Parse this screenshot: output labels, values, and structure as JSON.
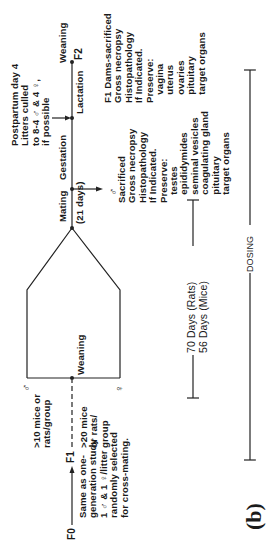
{
  "figure": {
    "panel_label": "(b)",
    "orientation": "rotated 90 degrees counterclockwise",
    "f0": {
      "label": "F0",
      "description": "Same as one-\ngeneration study\n1 ♂ & 1 ♀/litter\nrandomly selected\nfor cross-mating."
    },
    "f1": {
      "label": "F1"
    },
    "f2": {
      "label": "F2"
    },
    "male_branch": {
      "symbol": "♂",
      "group_text": ">10 mice or\nrats/group"
    },
    "female_branch": {
      "symbol": "♀",
      "group_text": ">20 mice\nor rats/\ngroup"
    },
    "events": {
      "weaning_f1": "Weaning",
      "mating": "Mating",
      "mating_duration": "(21 days)",
      "gestation": "Gestation",
      "lactation": "Lactation",
      "weaning_f2": "Weaning"
    },
    "postpartum_note": "Postpartum day 4\nLitters culled\nto 8-4 ♂ & 4 ♀,\nif possible",
    "male_sacrifice": {
      "symbol": "♂",
      "text": "Sacrificed\nGross necropsy\nHistopathology\nIf Indicated.\nPreserve:\n   testes\n   epididymides\n   seminal vesicles\n   coagulating gland\n   pituitary\n   target organs"
    },
    "dam_sacrifice": {
      "text": "F1 Dams-sacrificed\nGross necropsy\nHistopathology\nIf Indicated.\nPreserve:\n   vagina\n   uterus\n   ovaries\n   pituitary\n   target organs"
    },
    "premating_duration": "70 Days (Rats)\n56 Days (Mice)",
    "dosing_label": "DOSING"
  }
}
